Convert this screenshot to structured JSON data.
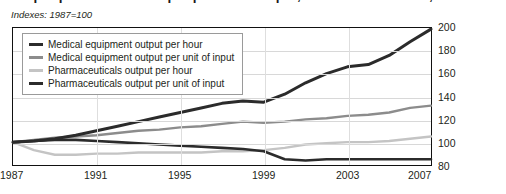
{
  "title": "Output per hour and output per unit of input, selected industries, 1987–2007",
  "subtitle": "Indexes: 1987=100",
  "legend": {
    "items": [
      {
        "label": "Medical equipment output per hour",
        "color": "#2b2b2b",
        "width": 3
      },
      {
        "label": "Medical equipment output per unit of input",
        "color": "#8c8c8c",
        "width": 2.4
      },
      {
        "label": "Pharmaceuticals output per hour",
        "color": "#c4c4c4",
        "width": 2.4
      },
      {
        "label": "Pharmaceuticals output per unit of input",
        "color": "#2b2b2b",
        "width": 2.6
      }
    ]
  },
  "chart_data": {
    "type": "line",
    "title": "Output per hour and output per unit of input, selected industries, 1987–2007",
    "subtitle": "Indexes: 1987=100",
    "xlabel": "",
    "ylabel": "",
    "xlim": [
      1987,
      2007
    ],
    "ylim": [
      80,
      200
    ],
    "yticks": [
      80,
      100,
      120,
      140,
      160,
      180,
      200
    ],
    "xticks": [
      1987,
      1991,
      1995,
      1999,
      2003,
      2007
    ],
    "grid": true,
    "legend_position": "upper-left",
    "x": [
      1987,
      1988,
      1989,
      1990,
      1991,
      1992,
      1993,
      1994,
      1995,
      1996,
      1997,
      1998,
      1999,
      2000,
      2001,
      2002,
      2003,
      2004,
      2005,
      2006,
      2007
    ],
    "series": [
      {
        "name": "Medical equipment output per hour",
        "color": "#2b2b2b",
        "values": [
          100,
          101,
          103,
          106,
          110,
          114,
          118,
          122,
          126,
          130,
          134,
          136,
          135,
          142,
          152,
          160,
          166,
          168,
          176,
          188,
          199
        ]
      },
      {
        "name": "Medical equipment output per unit of input",
        "color": "#8c8c8c",
        "values": [
          100,
          102,
          104,
          105,
          106,
          108,
          110,
          111,
          113,
          114,
          116,
          118,
          117,
          118,
          120,
          121,
          123,
          124,
          126,
          130,
          132
        ]
      },
      {
        "name": "Pharmaceuticals output per hour",
        "color": "#c4c4c4",
        "values": [
          100,
          93,
          89,
          89,
          90,
          90,
          91,
          91,
          91,
          91,
          92,
          92,
          93,
          95,
          98,
          99,
          100,
          100,
          101,
          103,
          105
        ]
      },
      {
        "name": "Pharmaceuticals output per unit of input",
        "color": "#2b2b2b",
        "values": [
          100,
          101,
          102,
          102,
          101,
          100,
          99,
          98,
          97,
          96,
          95,
          94,
          92,
          85,
          84,
          85,
          85,
          85,
          85,
          85,
          85
        ]
      }
    ]
  },
  "axes": {
    "y_tick_labels": [
      "200",
      "180",
      "160",
      "140",
      "120",
      "100",
      "80"
    ],
    "x_tick_labels": [
      "1987",
      "1991",
      "1995",
      "1999",
      "2003",
      "2007"
    ]
  }
}
